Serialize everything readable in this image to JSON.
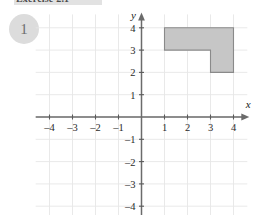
{
  "header": {
    "title": "Exercise 2.1",
    "band_color": "#e2e2e2"
  },
  "problem": {
    "number": "1",
    "bubble_color": "#dcdcdc"
  },
  "chart_data": {
    "type": "scatter",
    "title": "",
    "subtitle": "",
    "xlabel": "x",
    "ylabel": "y",
    "xlim": [
      -4.6,
      4.6
    ],
    "ylim": [
      -4.6,
      4.6
    ],
    "grid": true,
    "legend": null,
    "x_ticks": [
      -4,
      -3,
      -2,
      -1,
      1,
      2,
      3,
      4
    ],
    "y_ticks": [
      4,
      3,
      2,
      1,
      -1,
      -2,
      -3,
      -4
    ],
    "x_tick_labels": [
      "–4",
      "–3",
      "–2",
      "–1",
      "1",
      "2",
      "3",
      "4"
    ],
    "y_tick_labels": [
      "4",
      "3",
      "2",
      "1",
      "–1",
      "–2",
      "–3",
      "–4"
    ],
    "grid_color": "#e6e6e6",
    "axis_color": "#6b6b6b",
    "shapes": [
      {
        "name": "l-shaped-polygon",
        "kind": "polygon",
        "fill": "#c6c6c6",
        "stroke": "#8a8a8a",
        "vertices": [
          [
            1,
            4
          ],
          [
            4,
            4
          ],
          [
            4,
            2
          ],
          [
            3,
            2
          ],
          [
            3,
            3
          ],
          [
            1,
            3
          ]
        ]
      }
    ],
    "annotations": []
  },
  "axis_labels": {
    "x": "x",
    "y": "y"
  }
}
